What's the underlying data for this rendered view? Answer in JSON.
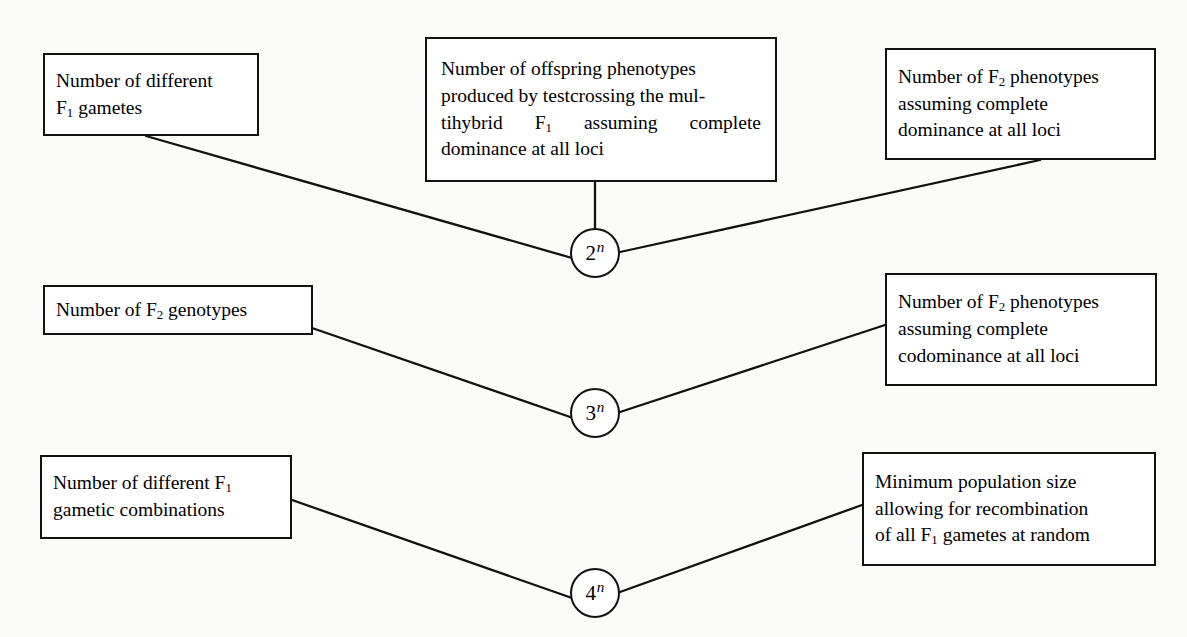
{
  "diagram": {
    "type": "relationship-diagram",
    "background_color": "#fbfbfa",
    "line_color": "#111111",
    "box_fill": "#ffffff",
    "nodes": [
      {
        "id": "f1-gametes",
        "position": "top-left",
        "lines": [
          "Number of different",
          "F₁ gametes"
        ],
        "line1": "Number of different",
        "line2_pre": "F",
        "line2_sub": "1",
        "line2_post": " gametes"
      },
      {
        "id": "testcross-offspring",
        "position": "top-center",
        "line1": "Number of offspring phenotypes",
        "line2": "produced by testcrossing the mul-",
        "line3_a": "tihybrid",
        "line3_sub_pre": "F",
        "line3_sub": "1",
        "line3_b": "assuming",
        "line3_c": "complete",
        "line4": "dominance at all loci"
      },
      {
        "id": "f2-phenotypes-dominance",
        "position": "top-right",
        "line1_pre": "Number of F",
        "line1_sub": "2",
        "line1_post": " phenotypes",
        "line2": "assuming complete",
        "line3": "dominance at all loci"
      },
      {
        "id": "f2-genotypes",
        "position": "middle-left",
        "line1_pre": "Number of F",
        "line1_sub": "2",
        "line1_post": " genotypes"
      },
      {
        "id": "f2-phenotypes-codominance",
        "position": "middle-right",
        "line1_pre": "Number of F",
        "line1_sub": "2",
        "line1_post": " phenotypes",
        "line2": "assuming complete",
        "line3": "codominance at all loci"
      },
      {
        "id": "f1-gametic-combinations",
        "position": "bottom-left",
        "line1_pre": "Number of different F",
        "line1_sub": "1",
        "line2": "gametic combinations"
      },
      {
        "id": "minimum-population",
        "position": "bottom-right",
        "line1": "Minimum population size",
        "line2": "allowing for recombination",
        "line3_pre": "of all F",
        "line3_sub": "1",
        "line3_post": " gametes at random"
      }
    ],
    "formulas": [
      {
        "id": "two-to-n",
        "base": "2",
        "exponent": "n",
        "label": "2ⁿ"
      },
      {
        "id": "three-to-n",
        "base": "3",
        "exponent": "n",
        "label": "3ⁿ"
      },
      {
        "id": "four-to-n",
        "base": "4",
        "exponent": "n",
        "label": "4ⁿ"
      }
    ],
    "edges": [
      {
        "from": "f1-gametes",
        "to": "two-to-n"
      },
      {
        "from": "testcross-offspring",
        "to": "two-to-n"
      },
      {
        "from": "f2-phenotypes-dominance",
        "to": "two-to-n"
      },
      {
        "from": "f2-genotypes",
        "to": "three-to-n"
      },
      {
        "from": "f2-phenotypes-codominance",
        "to": "three-to-n"
      },
      {
        "from": "f1-gametic-combinations",
        "to": "four-to-n"
      },
      {
        "from": "minimum-population",
        "to": "four-to-n"
      }
    ]
  }
}
